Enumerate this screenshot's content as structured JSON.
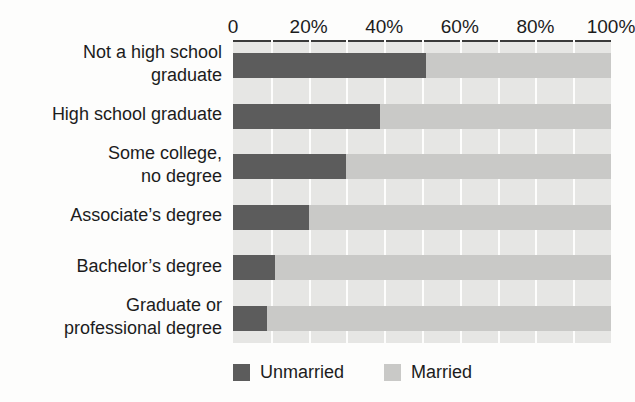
{
  "chart_data": {
    "type": "bar",
    "orientation": "horizontal",
    "stacked": true,
    "stacked_normalized": true,
    "title": "",
    "xlabel": "",
    "ylabel": "",
    "xlim": [
      0,
      100
    ],
    "xticks": [
      0,
      20,
      40,
      60,
      80,
      100
    ],
    "xtick_labels": [
      "0",
      "20%",
      "40%",
      "60%",
      "80%",
      "100%"
    ],
    "grid": true,
    "grid_orientation": "vertical",
    "grid_step": 10,
    "legend_position": "bottom",
    "categories": [
      "Not a high school\ngraduate",
      "High school graduate",
      "Some college,\nno degree",
      "Associate’s degree",
      "Bachelor’s degree",
      "Graduate or\nprofessional degree"
    ],
    "series": [
      {
        "name": "Unmarried",
        "color": "#5c5c5c",
        "values": [
          51,
          39,
          30,
          20,
          11,
          9
        ]
      },
      {
        "name": "Married",
        "color": "#c9c9c7",
        "values": [
          49,
          61,
          70,
          80,
          89,
          91
        ]
      }
    ]
  },
  "colors": {
    "unmarried": "#5c5c5c",
    "married": "#c9c9c7",
    "plot_background": "#e6e6e4",
    "gridline": "#fdfdfc",
    "axis_rule": "#3a3a3a",
    "page_background": "#fdfdfc",
    "text": "#1c1c1c"
  }
}
